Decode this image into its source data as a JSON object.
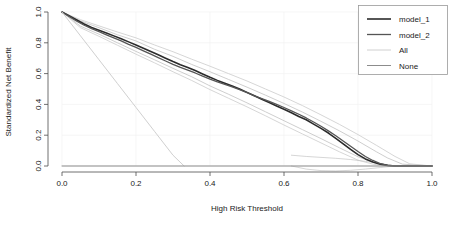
{
  "chart_data": {
    "type": "line",
    "title": "",
    "xlabel": "High Risk Threshold",
    "ylabel": "Standardized Net Benefit",
    "xlim": [
      0.0,
      1.0
    ],
    "ylim": [
      0.0,
      1.0
    ],
    "xticks": [
      "0.0",
      "0.2",
      "0.4",
      "0.6",
      "0.8",
      "1.0"
    ],
    "xtick_values": [
      0.0,
      0.2,
      0.4,
      0.6,
      0.8,
      1.0
    ],
    "yticks": [
      "0.0",
      "0.2",
      "0.4",
      "0.6",
      "0.8",
      "1.0"
    ],
    "ytick_values": [
      0.0,
      0.2,
      0.4,
      0.6,
      0.8,
      1.0
    ],
    "grid": "faint",
    "legend_position": "top-right",
    "legend": [
      {
        "label": "model_1",
        "color": "#2b2b2b",
        "width": 1.6
      },
      {
        "label": "model_2",
        "color": "#555555",
        "width": 1.3
      },
      {
        "label": "All",
        "color": "#d0d0d0",
        "width": 1.0
      },
      {
        "label": "None",
        "color": "#8c8c8c",
        "width": 1.0
      }
    ],
    "series": [
      {
        "name": "model_1",
        "color": "#2b2b2b",
        "width": 1.6,
        "x": [
          0.0,
          0.02,
          0.04,
          0.06,
          0.08,
          0.1,
          0.12,
          0.14,
          0.16,
          0.18,
          0.2,
          0.22,
          0.24,
          0.26,
          0.28,
          0.3,
          0.32,
          0.34,
          0.36,
          0.38,
          0.4,
          0.42,
          0.44,
          0.46,
          0.48,
          0.5,
          0.52,
          0.54,
          0.56,
          0.58,
          0.6,
          0.62,
          0.64,
          0.66,
          0.68,
          0.7,
          0.72,
          0.74,
          0.76,
          0.78,
          0.8,
          0.82,
          0.84,
          0.86,
          0.88,
          0.9,
          0.95,
          1.0
        ],
        "y": [
          1.0,
          0.975,
          0.948,
          0.922,
          0.9,
          0.882,
          0.864,
          0.845,
          0.826,
          0.806,
          0.786,
          0.765,
          0.744,
          0.722,
          0.7,
          0.678,
          0.658,
          0.64,
          0.62,
          0.598,
          0.576,
          0.556,
          0.538,
          0.52,
          0.5,
          0.478,
          0.456,
          0.434,
          0.412,
          0.39,
          0.368,
          0.346,
          0.322,
          0.3,
          0.272,
          0.244,
          0.214,
          0.18,
          0.144,
          0.108,
          0.074,
          0.046,
          0.026,
          0.012,
          0.004,
          0.0,
          0.0,
          0.0
        ]
      },
      {
        "name": "model_2",
        "color": "#555555",
        "width": 1.3,
        "x": [
          0.0,
          0.02,
          0.04,
          0.06,
          0.08,
          0.1,
          0.12,
          0.14,
          0.16,
          0.18,
          0.2,
          0.22,
          0.24,
          0.26,
          0.28,
          0.3,
          0.32,
          0.34,
          0.36,
          0.38,
          0.4,
          0.42,
          0.44,
          0.46,
          0.48,
          0.5,
          0.52,
          0.54,
          0.56,
          0.58,
          0.6,
          0.62,
          0.64,
          0.66,
          0.68,
          0.7,
          0.72,
          0.74,
          0.76,
          0.78,
          0.8,
          0.82,
          0.84,
          0.86,
          0.88,
          0.9,
          0.95,
          1.0
        ],
        "y": [
          1.0,
          0.97,
          0.94,
          0.914,
          0.892,
          0.872,
          0.852,
          0.832,
          0.812,
          0.79,
          0.77,
          0.748,
          0.726,
          0.704,
          0.682,
          0.66,
          0.64,
          0.622,
          0.604,
          0.584,
          0.564,
          0.546,
          0.53,
          0.514,
          0.496,
          0.476,
          0.456,
          0.438,
          0.42,
          0.4,
          0.38,
          0.358,
          0.336,
          0.312,
          0.286,
          0.258,
          0.228,
          0.196,
          0.162,
          0.128,
          0.094,
          0.062,
          0.036,
          0.016,
          0.004,
          0.0,
          0.0,
          0.0
        ]
      },
      {
        "name": "All",
        "color": "#d0d0d0",
        "width": 1.0,
        "x": [
          0.0,
          0.05,
          0.1,
          0.15,
          0.2,
          0.25,
          0.3,
          0.33
        ],
        "y": [
          1.0,
          0.845,
          0.69,
          0.535,
          0.38,
          0.225,
          0.07,
          0.0
        ]
      },
      {
        "name": "None",
        "color": "#8c8c8c",
        "width": 1.0,
        "x": [
          0.0,
          1.0
        ],
        "y": [
          0.0,
          0.0
        ]
      }
    ],
    "confidence_bands": [
      {
        "name": "model_1-upper",
        "color": "#bdbdbd",
        "x": [
          0.0,
          0.05,
          0.1,
          0.15,
          0.2,
          0.25,
          0.3,
          0.35,
          0.4,
          0.45,
          0.5,
          0.55,
          0.6,
          0.65,
          0.7,
          0.75,
          0.8,
          0.85,
          0.88,
          0.92,
          1.0
        ],
        "y": [
          1.0,
          0.942,
          0.898,
          0.852,
          0.812,
          0.758,
          0.712,
          0.66,
          0.612,
          0.562,
          0.512,
          0.46,
          0.406,
          0.35,
          0.29,
          0.228,
          0.162,
          0.092,
          0.052,
          0.012,
          0.0
        ]
      },
      {
        "name": "model_1-lower",
        "color": "#bdbdbd",
        "x": [
          0.0,
          0.05,
          0.1,
          0.15,
          0.2,
          0.25,
          0.3,
          0.35,
          0.4,
          0.45,
          0.5,
          0.55,
          0.6,
          0.65,
          0.7,
          0.75,
          0.8,
          0.84,
          0.88,
          0.92,
          1.0
        ],
        "y": [
          1.0,
          0.908,
          0.856,
          0.8,
          0.744,
          0.69,
          0.634,
          0.58,
          0.52,
          0.466,
          0.41,
          0.352,
          0.294,
          0.236,
          0.178,
          0.118,
          0.06,
          0.026,
          0.004,
          0.0,
          0.0
        ]
      },
      {
        "name": "model_2-upper",
        "color": "#c8c8c8",
        "x": [
          0.0,
          0.05,
          0.1,
          0.15,
          0.2,
          0.25,
          0.3,
          0.35,
          0.4,
          0.45,
          0.5,
          0.55,
          0.6,
          0.65,
          0.7,
          0.75,
          0.8,
          0.85,
          0.9,
          0.94,
          1.0
        ],
        "y": [
          1.0,
          0.95,
          0.91,
          0.87,
          0.832,
          0.786,
          0.742,
          0.694,
          0.648,
          0.6,
          0.552,
          0.5,
          0.448,
          0.392,
          0.332,
          0.27,
          0.204,
          0.134,
          0.062,
          0.014,
          0.0
        ]
      },
      {
        "name": "model_2-lower",
        "color": "#c8c8c8",
        "x": [
          0.0,
          0.05,
          0.1,
          0.15,
          0.2,
          0.25,
          0.3,
          0.35,
          0.4,
          0.45,
          0.5,
          0.55,
          0.6,
          0.65,
          0.7,
          0.75,
          0.8,
          0.84,
          0.88,
          0.92,
          1.0
        ],
        "y": [
          1.0,
          0.898,
          0.842,
          0.784,
          0.726,
          0.67,
          0.612,
          0.556,
          0.496,
          0.44,
          0.384,
          0.326,
          0.266,
          0.208,
          0.15,
          0.092,
          0.038,
          0.012,
          0.0,
          0.0,
          0.0
        ]
      },
      {
        "name": "tail-loop-upper",
        "color": "#c8c8c8",
        "x": [
          0.62,
          0.66,
          0.7,
          0.74,
          0.78,
          0.82,
          0.86,
          0.9
        ],
        "y": [
          0.07,
          0.062,
          0.056,
          0.05,
          0.042,
          0.03,
          0.016,
          0.0
        ]
      },
      {
        "name": "tail-loop-lower",
        "color": "#c8c8c8",
        "x": [
          0.62,
          0.66,
          0.7,
          0.74,
          0.78,
          0.82,
          0.86,
          0.9
        ],
        "y": [
          0.0,
          -0.02,
          -0.03,
          -0.032,
          -0.028,
          -0.02,
          -0.01,
          0.0
        ]
      }
    ]
  }
}
